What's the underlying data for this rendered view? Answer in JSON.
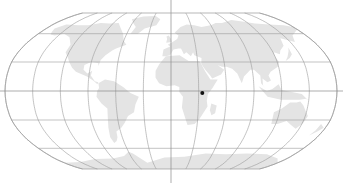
{
  "map": {
    "projection": "robinson",
    "colors": {
      "background": "#ffffff",
      "land": "#e4e4e4",
      "graticule": "#9a9a9a",
      "axis": "#8a8a8a",
      "marker": "#111111"
    },
    "graticule": {
      "meridian_step_deg": 30,
      "parallel_step_deg": 30
    },
    "marker": {
      "label": "location-marker",
      "lon": 34,
      "lat": -2
    }
  }
}
